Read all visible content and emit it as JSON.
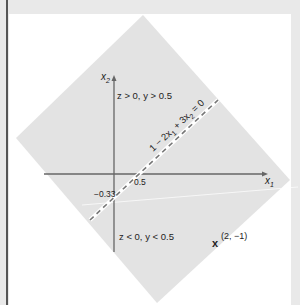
{
  "figure": {
    "axes": {
      "x_label": "x",
      "x_sub": "1",
      "y_label": "x",
      "y_sub": "2"
    },
    "ticks": {
      "x_intercept": "0.5",
      "y_intercept": "−0.33"
    },
    "boundary": {
      "label_parts": [
        "1 − 2x",
        "1",
        " + 3x",
        "2",
        " = 0"
      ]
    },
    "regions": {
      "upper": "z > 0, y > 0.5",
      "lower": "z < 0, y < 0.5"
    },
    "point": {
      "marker": "x",
      "coords": "(2, −1)"
    },
    "colors": {
      "background": "#e9e9e9",
      "panel": "#ffffff",
      "diamond": "#e3e3e3",
      "axis": "#666666",
      "dash": "#777777"
    }
  }
}
